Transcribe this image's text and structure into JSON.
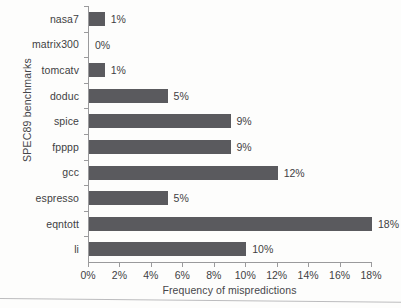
{
  "chart_data": {
    "type": "bar",
    "orientation": "horizontal",
    "title": "",
    "xlabel": "Frequency of mispredictions",
    "ylabel": "SPEC89 benchmarks",
    "categories": [
      "nasa7",
      "matrix300",
      "tomcatv",
      "doduc",
      "spice",
      "fpppp",
      "gcc",
      "espresso",
      "eqntott",
      "li"
    ],
    "values": [
      1,
      0,
      1,
      5,
      9,
      9,
      12,
      5,
      18,
      10
    ],
    "value_labels": [
      "1%",
      "0%",
      "1%",
      "5%",
      "9%",
      "9%",
      "12%",
      "5%",
      "18%",
      "10%"
    ],
    "xlim": [
      0,
      18
    ],
    "xticks": [
      0,
      2,
      4,
      6,
      8,
      10,
      12,
      14,
      16,
      18
    ],
    "xtick_labels": [
      "0%",
      "2%",
      "4%",
      "6%",
      "8%",
      "10%",
      "12%",
      "14%",
      "16%",
      "18%"
    ],
    "grid": false,
    "legend": null,
    "bar_color": "#5a5a5e",
    "axis_color": "#9a9a9c",
    "text_color": "#3f3f43",
    "background": "#fdfdfc"
  }
}
